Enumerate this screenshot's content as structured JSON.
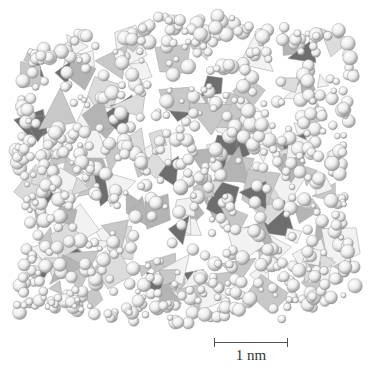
{
  "figure": {
    "scale_bar": {
      "label": "1 nm"
    },
    "colors": {
      "background": "#ffffff",
      "sphere_light": "#ffffff",
      "sphere_mid": "#e2e2e2",
      "sphere_dark": "#9a9a9a",
      "sphere_outline": "#8c8c8c",
      "polyhedron_light": "#f2f2f2",
      "polyhedron_mid": "#c8c8c8",
      "polyhedron_dark": "#6e6e6e",
      "polyhedron_edge": "#9e9e9e"
    }
  }
}
